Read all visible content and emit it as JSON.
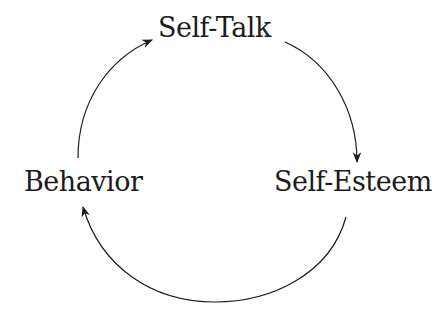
{
  "diagram": {
    "type": "cycle",
    "nodes": [
      {
        "id": "self-talk",
        "label": "Self-Talk"
      },
      {
        "id": "self-esteem",
        "label": "Self-Esteem"
      },
      {
        "id": "behavior",
        "label": "Behavior"
      }
    ],
    "edges": [
      {
        "from": "self-talk",
        "to": "self-esteem"
      },
      {
        "from": "self-esteem",
        "to": "behavior"
      },
      {
        "from": "behavior",
        "to": "self-talk"
      }
    ],
    "colors": {
      "stroke": "#1c1c1c",
      "text": "#1c1c1c",
      "background": "#ffffff"
    }
  }
}
